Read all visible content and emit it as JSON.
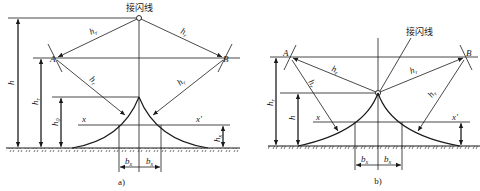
{
  "figure": {
    "panels": [
      {
        "id": "a",
        "caption": "a)",
        "wire_label": "接闪线",
        "point_A": "A",
        "point_B": "B",
        "radius_labels": [
          "h",
          "h",
          "h",
          "h"
        ],
        "radius_sub": "r",
        "dim_h": "h",
        "dim_hr": "h",
        "dim_hr_sub": "r",
        "dim_h0": "h",
        "dim_h0_sub": "0",
        "dim_hx": "h",
        "dim_hx_sub": "x",
        "line_x": "x",
        "line_x_prime": "x′",
        "bx_left": "b",
        "bx_right": "b",
        "bx_sub": "x"
      },
      {
        "id": "b",
        "caption": "b)",
        "wire_label": "接闪线",
        "point_A": "A",
        "point_B": "B",
        "radius_labels": [
          "h",
          "h",
          "h",
          "h"
        ],
        "radius_sub": "r",
        "dim_hr": "h",
        "dim_hr_sub": "r",
        "dim_h": "h",
        "line_x": "x",
        "line_x_prime": "x′",
        "bx_left": "b",
        "bx_right": "b",
        "bx_sub": "x"
      }
    ],
    "colors": {
      "stroke": "#1a1a1a",
      "background": "#ffffff"
    }
  }
}
